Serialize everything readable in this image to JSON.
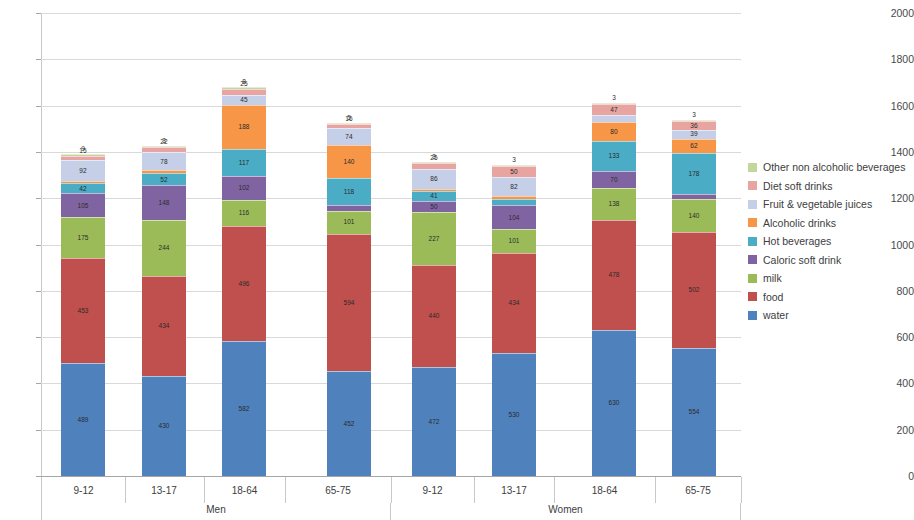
{
  "chart_data": {
    "type": "bar",
    "subtype": "stacked-column",
    "title": "",
    "xlabel": "",
    "ylabel": "",
    "ylim": [
      0,
      2000
    ],
    "ytick_step": 200,
    "yticks": [
      0,
      200,
      400,
      600,
      800,
      1000,
      1200,
      1400,
      1600,
      1800,
      2000
    ],
    "grid": true,
    "legend_position": "right",
    "groups": [
      {
        "name": "Men",
        "categories": [
          "9-12",
          "13-17",
          "18-64",
          "65-75"
        ]
      },
      {
        "name": "Women",
        "categories": [
          "9-12",
          "13-17",
          "18-64",
          "65-75"
        ]
      }
    ],
    "categories": [
      "9-12",
      "13-17",
      "18-64",
      "65-75",
      "9-12",
      "13-17",
      "18-64",
      "65-75"
    ],
    "stack_order_bottom_to_top": [
      "water",
      "food",
      "milk",
      "Caloric soft drink",
      "Hot beverages",
      "Alcoholic drinks",
      "Fruit & vegetable juices",
      "Diet soft drinks",
      "Other non alcoholic beverages"
    ],
    "series": [
      {
        "name": "water",
        "color": "#4f81bd",
        "values": [
          489,
          430,
          582,
          452,
          472,
          530,
          630,
          554
        ]
      },
      {
        "name": "food",
        "color": "#c0504d",
        "values": [
          453,
          434,
          496,
          594,
          440,
          434,
          478,
          502
        ]
      },
      {
        "name": "milk",
        "color": "#9bbb59",
        "values": [
          175,
          244,
          116,
          101,
          227,
          101,
          138,
          140
        ]
      },
      {
        "name": "Caloric soft drink",
        "color": "#8064a2",
        "values": [
          105,
          148,
          102,
          24,
          50,
          104,
          70,
          21
        ]
      },
      {
        "name": "Hot beverages",
        "color": "#4bacc6",
        "values": [
          42,
          52,
          117,
          118,
          41,
          29,
          133,
          178
        ]
      },
      {
        "name": "Alcoholic drinks",
        "color": "#f79646",
        "values": [
          10,
          12,
          188,
          140,
          10,
          10,
          80,
          62
        ]
      },
      {
        "name": "Fruit & vegetable juices",
        "color": "#c6cfe8",
        "values": [
          92,
          78,
          45,
          74,
          86,
          82,
          30,
          39
        ]
      },
      {
        "name": "Diet soft drinks",
        "color": "#e8a4a0",
        "values": [
          15,
          22,
          25,
          16,
          25,
          50,
          47,
          36
        ]
      },
      {
        "name": "Other non alcoholic beverages",
        "color": "#c3d69b",
        "values": [
          9,
          3,
          8,
          5,
          3,
          3,
          3,
          3
        ]
      }
    ],
    "totals": [
      1440,
      1403,
      1716,
      1595,
      1344,
      1252,
      1621,
      1589
    ],
    "visible_labels": {
      "bar_0": {
        "water": "489",
        "food": "453",
        "milk": "175",
        "caloric": "105",
        "hot": "42",
        "juices": "92",
        "other": "9"
      },
      "bar_1": {
        "water": "430",
        "food": "434",
        "milk": "244",
        "caloric": "148",
        "hot": "52",
        "juices": "78",
        "diet": "22"
      },
      "bar_2": {
        "water": "582",
        "food": "496",
        "milk": "116",
        "caloric": "102",
        "hot": "117",
        "alcoholic": "188",
        "juices": "45",
        "diet": "25",
        "other": "8"
      },
      "bar_3": {
        "water": "452",
        "food": "594",
        "milk": "101",
        "caloric": "24",
        "hot": "118",
        "alcoholic": "140",
        "juices": "74",
        "other": "5"
      },
      "bar_4": {
        "water": "472",
        "food": "440",
        "milk": "227",
        "caloric": "50",
        "hot": "41",
        "juices": "86",
        "diet": "25"
      },
      "bar_5": {
        "water": "530",
        "food": "434",
        "milk": "101",
        "caloric": "104",
        "hot": "29",
        "juices": "82",
        "diet": "50"
      },
      "bar_6": {
        "water": "630",
        "food": "478",
        "milk": "138",
        "caloric": "70",
        "hot": "133",
        "alcoholic": "80",
        "juices": "30",
        "diet": "47",
        "other": "3"
      },
      "bar_7": {
        "water": "554",
        "food": "502",
        "milk": "140",
        "caloric": "21",
        "hot": "178",
        "alcoholic": "62",
        "juices": "39",
        "diet": "36",
        "other": "3"
      }
    }
  },
  "axis": {
    "ytick_labels": [
      "2000",
      "1800",
      "1600",
      "1400",
      "1200",
      "1000",
      "800",
      "600",
      "400",
      "200",
      "0"
    ]
  },
  "legend": {
    "items": [
      {
        "label": "Other non alcoholic beverages",
        "color": "#c3d69b"
      },
      {
        "label": "Diet soft drinks",
        "color": "#e8a4a0"
      },
      {
        "label": "Fruit & vegetable juices",
        "color": "#c6cfe8"
      },
      {
        "label": "Alcoholic drinks",
        "color": "#f79646"
      },
      {
        "label": " Hot beverages",
        "color": "#4bacc6"
      },
      {
        "label": "Caloric soft drink",
        "color": "#8064a2"
      },
      {
        "label": "milk",
        "color": "#9bbb59"
      },
      {
        "label": "food",
        "color": "#c0504d"
      },
      {
        "label": "water",
        "color": "#4f81bd"
      }
    ]
  },
  "category_axis": {
    "tick_labels": [
      "9-12",
      "13-17",
      "18-64",
      "65-75",
      "9-12",
      "13-17",
      "18-64",
      "65-75"
    ],
    "group_labels": [
      "Men",
      "Women"
    ]
  }
}
